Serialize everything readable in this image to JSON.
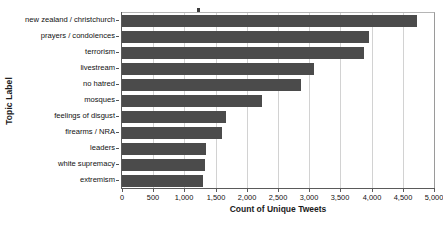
{
  "chart_data": {
    "type": "bar",
    "orientation": "horizontal",
    "title": "",
    "xlabel": "Count of Unique Tweets",
    "ylabel": "Topic Label",
    "categories": [
      "new zealand / christchurch",
      "prayers / condolences",
      "terrorism",
      "livestream",
      "no hatred",
      "mosques",
      "feelings of disgust",
      "firearms / NRA",
      "leaders",
      "white supremacy",
      "extremism"
    ],
    "values": [
      4730,
      3960,
      3880,
      3080,
      2870,
      2250,
      1670,
      1600,
      1350,
      1330,
      1300
    ],
    "xlim": [
      0,
      5000
    ],
    "xticks": [
      0,
      500,
      1000,
      1500,
      2000,
      2500,
      3000,
      3500,
      4000,
      4500,
      5000
    ],
    "xtick_labels": [
      "0",
      "500",
      "1,000",
      "1,500",
      "2,000",
      "2,500",
      "3,000",
      "3,500",
      "4,000",
      "4,500",
      "5,000"
    ],
    "grid": "vertical",
    "legend": null,
    "bar_color": "#4b4b4b",
    "grid_color": "#d2d2d2",
    "axis_color": "#5a5a5a",
    "background": "#ffffff"
  }
}
